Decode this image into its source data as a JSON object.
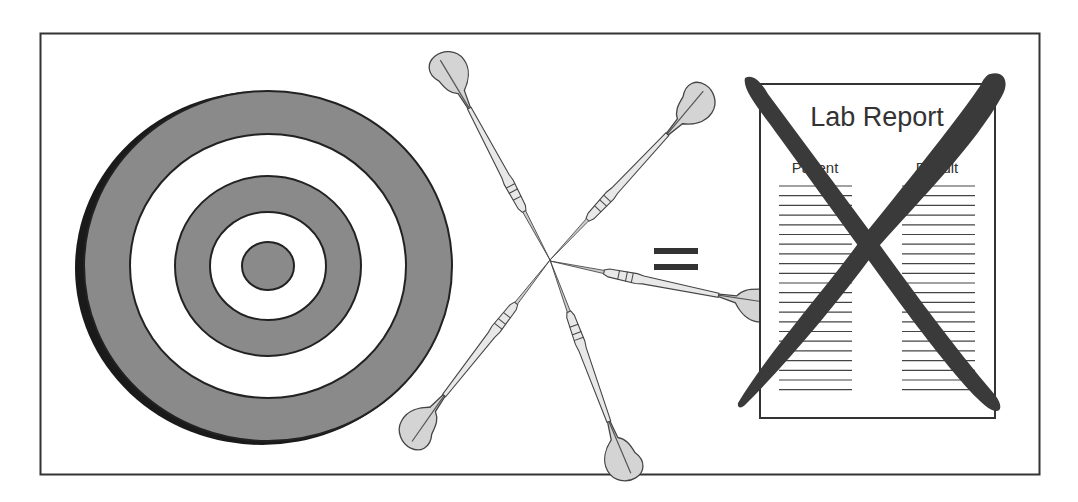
{
  "illustration": {
    "description": "Darts scattered around a target equals an invalid lab report",
    "colors": {
      "ring_dark": "#8a8a8a",
      "ring_light": "#ffffff",
      "outline": "#222222",
      "flight_fill": "#d4d4d4",
      "cross_mark": "#3a3a3a",
      "frame": "#333333"
    },
    "target": {
      "label": "target",
      "dart_hits": 1
    },
    "darts": {
      "count": 5,
      "pattern": "X cluster away from bullseye"
    },
    "equals_sign": "=",
    "lab_report": {
      "title": "Lab Report",
      "columns": [
        "Patient",
        "Result"
      ],
      "line_count_per_column": 20,
      "status": "crossed out"
    }
  }
}
